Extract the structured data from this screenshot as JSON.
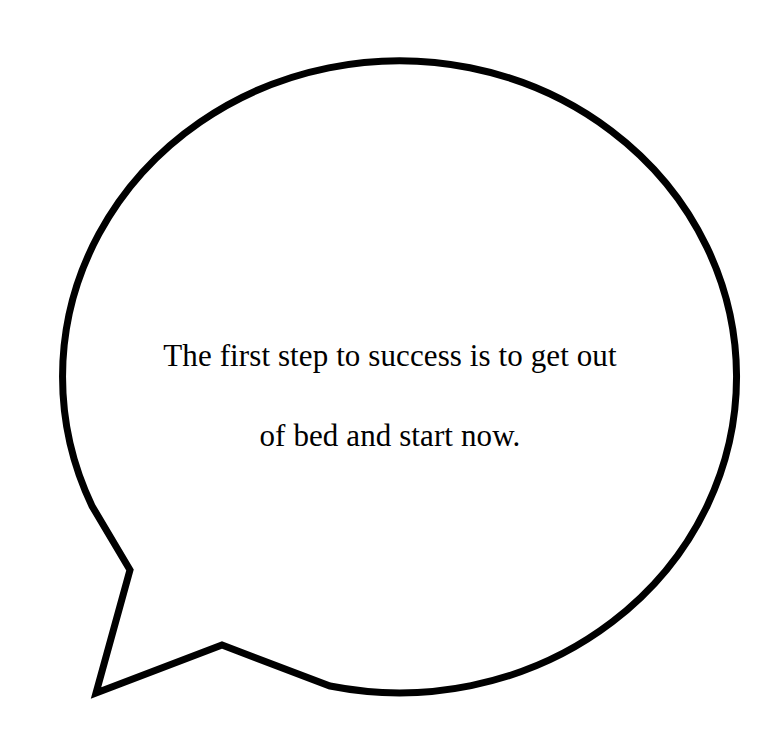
{
  "canvas": {
    "width": 779,
    "height": 742,
    "background_color": "#ffffff"
  },
  "bubble": {
    "shape": "speech-bubble-ellipse-with-tail",
    "stroke_color": "#000000",
    "fill_color": "#ffffff",
    "stroke_width": 7,
    "ellipse": {
      "center_x": 385,
      "center_y": 376,
      "radius_x": 337,
      "radius_y": 316
    },
    "tail": {
      "description": "polygonal tail at lower-left pointing down-left",
      "attach_upper_x": 92,
      "attach_upper_y": 506,
      "notch_x": 130,
      "notch_y": 570,
      "tip_x": 96,
      "tip_y": 693,
      "vertex_x": 222,
      "vertex_y": 645,
      "attach_lower_x": 330,
      "attach_lower_y": 686
    }
  },
  "quote": {
    "full_text": "The first step to success is to get out of bed and start now.",
    "lines": [
      "The first step to success is to get out",
      "of bed and start now."
    ],
    "line_1": "The first step to success is to get out",
    "line_2": "of bed and start now.",
    "text_color": "#000000",
    "font_size_px": 31,
    "align": "center"
  }
}
